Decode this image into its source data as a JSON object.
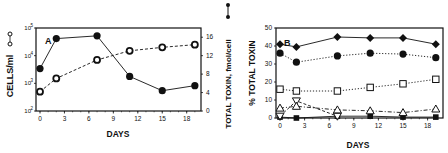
{
  "chart_data": [
    {
      "panel": "A",
      "type": "line",
      "panel_label": "A",
      "xlabel": "DAYS",
      "ylabel_left": "CELLS/ml",
      "ylabel_right": "TOTAL TOXIN, fmol/cell",
      "x_ticks": [
        "0",
        "3",
        "6",
        "9",
        "12",
        "15",
        "18"
      ],
      "y_left_ticks": [
        "10^2",
        "10^3",
        "10^4",
        "10^5"
      ],
      "y_left_scale": "log",
      "y_left_range": [
        100,
        100000
      ],
      "y_right_ticks": [
        "0",
        "4",
        "8",
        "12",
        "16"
      ],
      "y_right_range": [
        0,
        18
      ],
      "x_range": [
        -1,
        20
      ],
      "grid": false,
      "series": [
        {
          "name": "CELLS/ml",
          "axis": "left",
          "marker": "open-circle",
          "line": "dashed",
          "x": [
            0,
            2,
            7,
            11,
            15,
            19
          ],
          "y": [
            500,
            1500,
            7000,
            15000,
            20000,
            25000
          ]
        },
        {
          "name": "TOTAL TOXIN, fmol/cell",
          "axis": "right",
          "marker": "filled-circle",
          "line": "solid",
          "x": [
            0,
            2,
            7,
            11,
            15,
            19
          ],
          "y": [
            9.2,
            15.7,
            16.3,
            7.5,
            4.4,
            5.5
          ]
        }
      ]
    },
    {
      "panel": "B",
      "type": "line",
      "panel_label": "B",
      "xlabel": "DAYS",
      "ylabel": "% TOTAL TOXIN",
      "x_ticks": [
        "0",
        "3",
        "6",
        "9",
        "12",
        "15",
        "18"
      ],
      "y_ticks": [
        "0",
        "10",
        "20",
        "30",
        "40",
        "50"
      ],
      "y_range": [
        0,
        50
      ],
      "x_range": [
        -1,
        20
      ],
      "grid": false,
      "series": [
        {
          "name": "filled diamond",
          "marker": "filled-diamond",
          "line": "solid",
          "x": [
            0,
            2,
            7,
            11,
            15,
            19
          ],
          "y": [
            41,
            39.5,
            45,
            44.5,
            44.5,
            41
          ]
        },
        {
          "name": "filled circle",
          "marker": "filled-circle",
          "line": "dotted",
          "x": [
            0,
            2,
            7,
            11,
            15,
            19
          ],
          "y": [
            36,
            31,
            34.5,
            36,
            35.5,
            33.5
          ]
        },
        {
          "name": "open square",
          "marker": "open-square",
          "line": "dotted",
          "x": [
            0,
            2,
            7,
            11,
            15,
            19
          ],
          "y": [
            16,
            15,
            15,
            17,
            19,
            21.5
          ]
        },
        {
          "name": "open triangle",
          "marker": "open-triangle",
          "line": "dash-dot",
          "x": [
            0,
            2,
            7,
            11,
            15,
            19
          ],
          "y": [
            5.5,
            6.5,
            4.5,
            4,
            3,
            5
          ]
        },
        {
          "name": "open inverted triangle",
          "marker": "open-inverted-triangle",
          "line": "dashed",
          "x": [
            0,
            2,
            7
          ],
          "y": [
            1,
            9.5,
            1
          ]
        },
        {
          "name": "filled square",
          "marker": "filled-square",
          "line": "solid",
          "x": [
            0,
            2,
            7,
            11,
            15,
            19
          ],
          "y": [
            0.5,
            0,
            1,
            1,
            0.5,
            0.5
          ]
        }
      ]
    }
  ],
  "labels": {
    "a_panel": "A",
    "b_panel": "B",
    "a_xlabel": "DAYS",
    "b_xlabel": "DAYS",
    "a_ylabel_left": "CELLS/ml",
    "a_ylabel_right": "TOTAL TOXIN, fmol/cell",
    "b_ylabel": "% TOTAL TOXIN",
    "x_ticks": [
      "0",
      "3",
      "6",
      "9",
      "12",
      "15",
      "18"
    ],
    "a_left_ticks_base": [
      "10",
      "10",
      "10",
      "10"
    ],
    "a_left_ticks_exp": [
      "2",
      "3",
      "4",
      "5"
    ],
    "a_right_ticks": [
      "0",
      "4",
      "8",
      "12",
      "16"
    ],
    "b_ticks": [
      "0",
      "10",
      "20",
      "30",
      "40",
      "50"
    ]
  }
}
